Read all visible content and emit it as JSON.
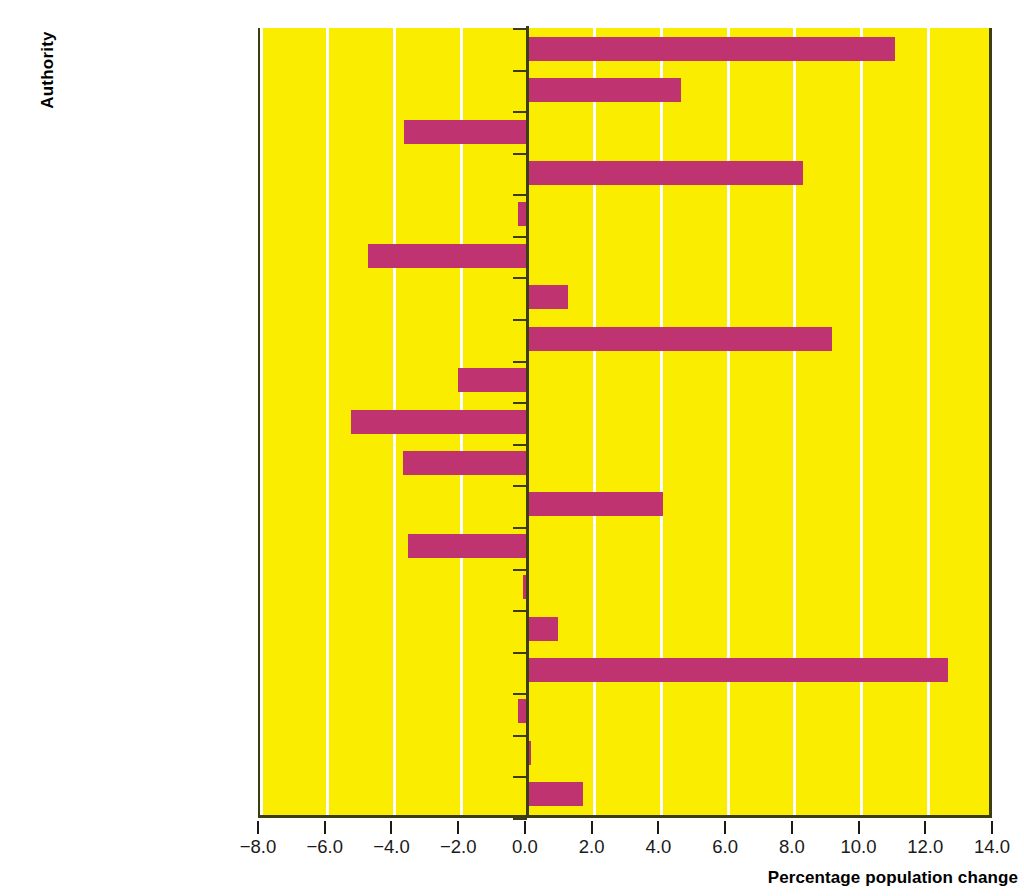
{
  "chart_data": {
    "type": "bar",
    "orientation": "horizontal",
    "title": "",
    "xlabel": "Percentage population change",
    "ylabel": "Authority",
    "xlim": [
      -8.0,
      14.0
    ],
    "xticks": [
      "-8.0",
      "-6.0",
      "-4.0",
      "-2.0",
      "0.0",
      "2.0",
      "4.0",
      "6.0",
      "8.0",
      "10.0",
      "12.0",
      "14.0"
    ],
    "xtick_values": [
      -8,
      -6,
      -4,
      -2,
      0,
      2,
      4,
      6,
      8,
      10,
      12,
      14
    ],
    "grid": "vertical-white-gridlines-every-2-units",
    "legend": "none",
    "plot_background": "#faed00",
    "bar_color": "#bf3470",
    "axis_color": "#3d3d14",
    "categories": [
      "York",
      "West Yorkshire",
      "Tyne and Wear",
      "Stockton",
      "South Yorkshire",
      "Redcar and Cleveland",
      "Northumberland",
      "North Yorkshire",
      "Northeast Lincolnshire",
      "Middlesbrough",
      "Merseyside",
      "Lancashire",
      "Hull",
      "Hartlepool",
      "Greater Manchester",
      "East Riding",
      "Durham",
      "Darlington",
      "Cumbria"
    ],
    "values": [
      11.0,
      4.6,
      -3.7,
      8.25,
      -0.3,
      -4.8,
      1.2,
      9.1,
      -2.1,
      -5.3,
      -3.75,
      4.05,
      -3.6,
      -0.15,
      0.9,
      12.6,
      -0.3,
      0.05,
      1.65
    ]
  }
}
